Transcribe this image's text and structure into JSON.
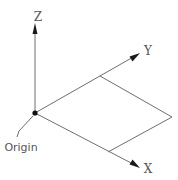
{
  "diagram": {
    "axes": {
      "z": {
        "label": "Z"
      },
      "y": {
        "label": "Y"
      },
      "x": {
        "label": "X"
      }
    },
    "origin": {
      "label": "Origin"
    },
    "colors": {
      "line": "#6e6e6e",
      "arrow": "#1a1a1a",
      "text": "#555555",
      "background": "#ffffff"
    }
  }
}
